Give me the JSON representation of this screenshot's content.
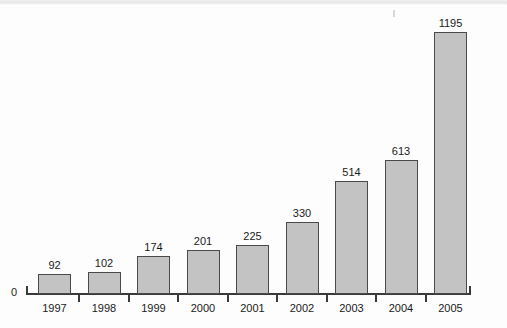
{
  "chart_data": {
    "type": "bar",
    "title": "",
    "subtitle": "",
    "xlabel": "",
    "ylabel": "",
    "categories": [
      "1997",
      "1998",
      "1999",
      "2000",
      "2001",
      "2002",
      "2003",
      "2004",
      "2005"
    ],
    "values": [
      92,
      102,
      174,
      201,
      225,
      330,
      514,
      613,
      1195
    ],
    "data_labels": [
      "92",
      "102",
      "174",
      "201",
      "225",
      "330",
      "514",
      "613",
      "1195"
    ],
    "series": [
      {
        "name": "",
        "values": [
          92,
          102,
          174,
          201,
          225,
          330,
          514,
          613,
          1195
        ]
      }
    ],
    "ylim": [
      0,
      1195
    ],
    "y_axis_labels": [
      "0"
    ],
    "grid": false,
    "legend": false,
    "legend_position": "none",
    "annotations": []
  },
  "axis": {
    "origin_label": "0"
  },
  "style": {
    "bar_fill": "#c3c3c3",
    "bar_stroke": "#4a4a4a",
    "axis_color": "#3a3a3a",
    "text_color": "#1a1a1a",
    "background": "#fdfdfd"
  }
}
